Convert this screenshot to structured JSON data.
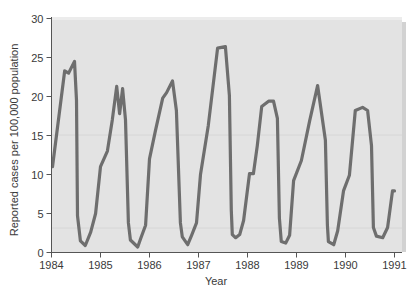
{
  "chart_data": {
    "type": "line",
    "title": "",
    "xlabel": "Year",
    "ylabel": "Reported cases per 100,000 population",
    "xlim": [
      1984,
      1991
    ],
    "ylim": [
      0,
      30
    ],
    "x_ticks": [
      "1984",
      "1985",
      "1986",
      "1987",
      "1988",
      "1989",
      "1990",
      "1991"
    ],
    "y_ticks": [
      "0",
      "5",
      "10",
      "15",
      "20",
      "25",
      "30"
    ],
    "grid": false,
    "legend": null,
    "line_color": "#6e6e6e",
    "plot_background": "#e3e3e3",
    "series": [
      {
        "name": "Reported cases",
        "x": [
          1984.02,
          1984.27,
          1984.35,
          1984.47,
          1984.51,
          1984.53,
          1984.59,
          1984.69,
          1984.8,
          1984.9,
          1985.0,
          1985.14,
          1985.24,
          1985.33,
          1985.39,
          1985.45,
          1985.51,
          1985.57,
          1985.61,
          1985.76,
          1985.82,
          1985.92,
          1986.0,
          1986.12,
          1986.27,
          1986.35,
          1986.47,
          1986.55,
          1986.63,
          1986.67,
          1986.78,
          1986.86,
          1986.96,
          1987.04,
          1987.2,
          1987.39,
          1987.55,
          1987.63,
          1987.67,
          1987.69,
          1987.76,
          1987.84,
          1987.92,
          1988.04,
          1988.12,
          1988.2,
          1988.29,
          1988.43,
          1988.53,
          1988.61,
          1988.65,
          1988.69,
          1988.78,
          1988.86,
          1988.94,
          1989.1,
          1989.27,
          1989.43,
          1989.59,
          1989.63,
          1989.65,
          1989.76,
          1989.84,
          1989.96,
          1990.08,
          1990.2,
          1990.35,
          1990.45,
          1990.53,
          1990.57,
          1990.63,
          1990.76,
          1990.86,
          1990.96,
          1991.0
        ],
        "y": [
          11.0,
          23.3,
          23.0,
          24.5,
          19.5,
          4.7,
          1.5,
          0.9,
          2.6,
          5.0,
          11.0,
          13.0,
          17.0,
          21.3,
          17.8,
          21.0,
          17.0,
          3.8,
          1.6,
          0.7,
          1.8,
          3.5,
          12.0,
          15.6,
          19.8,
          20.5,
          22.0,
          18.2,
          3.8,
          2.0,
          1.0,
          2.2,
          3.8,
          10.0,
          16.3,
          26.2,
          26.4,
          20.1,
          5.4,
          2.3,
          1.9,
          2.3,
          4.1,
          10.1,
          10.1,
          13.7,
          18.7,
          19.4,
          19.4,
          17.2,
          4.4,
          1.4,
          1.2,
          2.2,
          9.2,
          11.8,
          16.9,
          21.4,
          14.4,
          3.5,
          1.4,
          1.0,
          2.8,
          7.9,
          9.9,
          18.2,
          18.6,
          18.2,
          13.7,
          3.2,
          2.1,
          1.9,
          3.2,
          7.9,
          7.9
        ]
      }
    ]
  }
}
